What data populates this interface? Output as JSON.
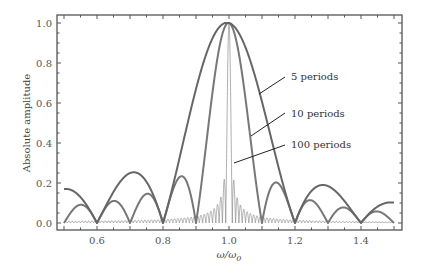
{
  "chart_data": {
    "type": "line",
    "title": "",
    "xlabel": "ω/ω0",
    "ylabel": "Absolute amplitude",
    "xlim": [
      0.5,
      1.5
    ],
    "ylim": [
      0.0,
      1.0
    ],
    "x_ticks": [
      "0.6",
      "0.8",
      "1.0",
      "1.2",
      "1.4"
    ],
    "y_ticks": [
      "0.0",
      "0.2",
      "0.4",
      "0.6",
      "0.8",
      "1.0"
    ],
    "grid": false,
    "legend_position": "annotations right of center peak",
    "series": [
      {
        "name": "5 periods",
        "periods": 5,
        "color": "#666666",
        "x": [
          0.5,
          0.55,
          0.6,
          0.65,
          0.7,
          0.75,
          0.8,
          0.85,
          0.9,
          0.95,
          1.0,
          1.05,
          1.1,
          1.15,
          1.2,
          1.25,
          1.3,
          1.35,
          1.4,
          1.45,
          1.5
        ],
        "values": [
          0.17,
          0.13,
          0.0,
          0.15,
          0.25,
          0.19,
          0.0,
          0.34,
          0.64,
          0.87,
          1.0,
          0.88,
          0.62,
          0.3,
          0.0,
          0.13,
          0.17,
          0.09,
          0.0,
          0.1,
          0.1
        ]
      },
      {
        "name": "10 periods",
        "periods": 10,
        "color": "#777777",
        "x": [
          0.5,
          0.55,
          0.6,
          0.65,
          0.7,
          0.75,
          0.8,
          0.85,
          0.9,
          0.95,
          1.0,
          1.05,
          1.1,
          1.15,
          1.2,
          1.25,
          1.3,
          1.35,
          1.4,
          1.45,
          1.5
        ],
        "values": [
          0.0,
          0.09,
          0.0,
          0.11,
          0.0,
          0.15,
          0.0,
          0.23,
          0.0,
          0.65,
          1.0,
          0.62,
          0.0,
          0.19,
          0.0,
          0.11,
          0.0,
          0.08,
          0.0,
          0.06,
          0.0
        ]
      },
      {
        "name": "100 periods",
        "periods": 100,
        "color": "#888888",
        "x": [
          0.5,
          0.8,
          0.9,
          0.95,
          0.98,
          0.99,
          0.995,
          1.0,
          1.005,
          1.01,
          1.02,
          1.05,
          1.1,
          1.2,
          1.5
        ],
        "values": [
          0.017,
          0.018,
          0.034,
          0.065,
          0.16,
          0.32,
          0.64,
          1.0,
          0.63,
          0.31,
          0.16,
          0.06,
          0.03,
          0.015,
          0.0
        ]
      }
    ],
    "annotations": [
      "5 periods",
      "10 periods",
      "100 periods"
    ]
  },
  "legend": {
    "label_5": "5 periods",
    "label_10": "10 periods",
    "label_100": "100 periods"
  },
  "axes": {
    "ylabel": "Absolute amplitude",
    "xlabel_main": "ω/ω",
    "xlabel_sub": "0"
  }
}
